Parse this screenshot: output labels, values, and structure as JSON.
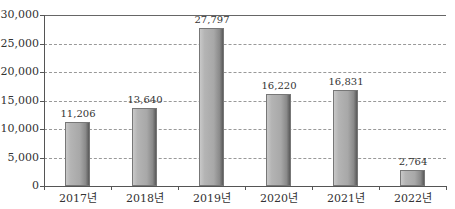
{
  "chart_data": {
    "type": "bar",
    "title": "",
    "xlabel": "",
    "ylabel": "",
    "categories": [
      "2017년",
      "2018년",
      "2019년",
      "2020년",
      "2021년",
      "2022년"
    ],
    "values": [
      11206,
      13640,
      27797,
      16220,
      16831,
      2764
    ],
    "value_labels": [
      "11,206",
      "13,640",
      "27,797",
      "16,220",
      "16,831",
      "2,764"
    ],
    "ylim": [
      0,
      30000
    ],
    "yticks": [
      0,
      5000,
      10000,
      15000,
      20000,
      25000,
      30000
    ],
    "ytick_labels": [
      "0",
      "5,000",
      "10,000",
      "15,000",
      "20,000",
      "25,000",
      "30,000"
    ],
    "grid": true,
    "grid_style": "dashed horizontal",
    "legend": "none",
    "bar_color": "#a8a8a8"
  }
}
